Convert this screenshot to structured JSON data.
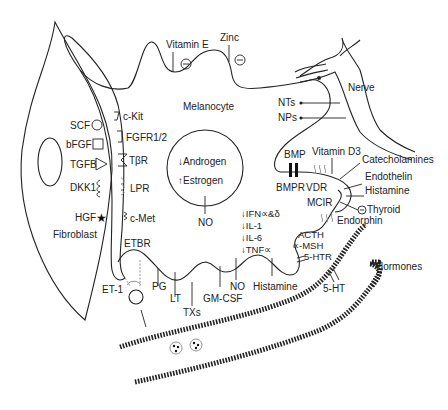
{
  "diagram": {
    "cells": {
      "fibroblast": "Fibroblast",
      "melanocyte": "Melanocyte",
      "nerve": "Nerve"
    },
    "fibroblast_factors": [
      {
        "label": "SCF",
        "shape": "circle"
      },
      {
        "label": "bFGF",
        "shape": "square"
      },
      {
        "label": "TGFB",
        "shape": "triangle"
      },
      {
        "label": "DKK1",
        "shape": "coil"
      },
      {
        "label": "HGF",
        "shape": "star"
      }
    ],
    "receptors_left": [
      {
        "label": "c-Kit"
      },
      {
        "label": "FGFR1/2"
      },
      {
        "label": "TβR"
      },
      {
        "label": "LPR"
      },
      {
        "label": "c-Met"
      },
      {
        "label": "ETBR"
      }
    ],
    "top_inputs": [
      {
        "label": "Vitamin E",
        "effect": "⊖"
      },
      {
        "label": "Zinc",
        "effect": "⊖"
      }
    ],
    "nucleus": {
      "items": [
        {
          "arrow": "↓",
          "label": "Androgen"
        },
        {
          "arrow": "↑",
          "label": "Estrogen"
        }
      ],
      "below_label": "NO"
    },
    "nerve_signals": [
      {
        "label": "NTs"
      },
      {
        "label": "NPs"
      }
    ],
    "right_side": {
      "bmp": "BMP",
      "bmpr": "BMPR",
      "vitamin_d3": "Vitamin D3",
      "vdr": "VDR",
      "mcir": "MCIR",
      "endorphin": "Endorphin",
      "catecholamines": "Catecholamines",
      "endothelin": "Endothelin",
      "histamine": "Histamine",
      "thyroid": "Thyroid",
      "acth": "ACTH",
      "msh": "∝-MSH",
      "htr": "5-HTR",
      "ht": "5-HT",
      "hormones": "Hormones"
    },
    "cytokines": [
      {
        "arrow": "↓",
        "label": "IFN∝&δ"
      },
      {
        "arrow": "↓",
        "label": "IL-1"
      },
      {
        "arrow": "↓",
        "label": "IL-6"
      },
      {
        "arrow": "↓",
        "label": "TNF∝"
      }
    ],
    "bottom_inputs": [
      {
        "label": "ET-1"
      },
      {
        "label": "PG"
      },
      {
        "label": "LT"
      },
      {
        "label": "TXs"
      },
      {
        "label": "GM-CSF"
      },
      {
        "label": "NO"
      },
      {
        "label": "Histamine"
      }
    ]
  }
}
